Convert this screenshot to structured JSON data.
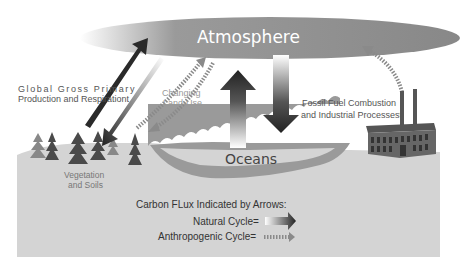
{
  "atmosphere": {
    "label": "Atmosphere"
  },
  "oceans": {
    "label": "Oceans"
  },
  "gpp": {
    "line1": "Global Gross Primary",
    "line2": "Production and Respirationt"
  },
  "land_use": {
    "line1": "Changing",
    "line2": "Land-Use"
  },
  "fossil": {
    "line1": "Fossil Fuel Combustion",
    "line2": "and Industrial Processest"
  },
  "vegetation": {
    "line1": "Vegetation",
    "line2": "and Soils"
  },
  "legend": {
    "title": "Carbon FLux Indicated by Arrows:",
    "natural": "Natural Cycle=",
    "anthropogenic": "Anthropogenic Cycle="
  },
  "colors": {
    "atmosphere": "#8f8f8f",
    "ground": "#d4d4d4",
    "ocean": "#9a9a9a",
    "arrow_dark": "#2a2a2a",
    "dotted": "#8a8a8a",
    "tree": "#4a4a4a",
    "factory": "#555555"
  }
}
